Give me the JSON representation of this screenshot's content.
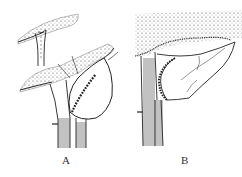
{
  "figure": {
    "panels": [
      {
        "id": "A",
        "label": "A",
        "description": "Skin flap raised from tissue; oval graft with sutured edge detached, upper small flap pedicle"
      },
      {
        "id": "B",
        "label": "B",
        "description": "Flap rotated and sutured into place along the pedicle"
      }
    ]
  },
  "colors": {
    "ink": "#2a2a2a",
    "background": "#ffffff"
  }
}
